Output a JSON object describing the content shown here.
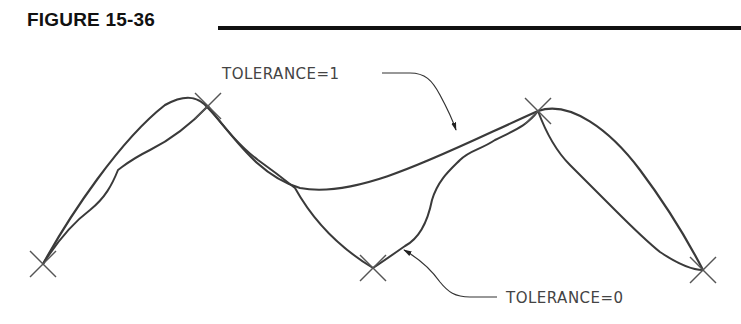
{
  "figure": {
    "title": "FIGURE 15-36"
  },
  "labels": {
    "tolerance_1": "TOLERANCE=1",
    "tolerance_0": "TOLERANCE=0"
  },
  "fit_points": [
    {
      "x": 43,
      "y": 264
    },
    {
      "x": 208,
      "y": 106
    },
    {
      "x": 373,
      "y": 268
    },
    {
      "x": 538,
      "y": 111
    },
    {
      "x": 703,
      "y": 270
    }
  ],
  "colors": {
    "curve": "#3a3a3a",
    "marker": "#555555",
    "text": "#444444",
    "title": "#111111"
  }
}
